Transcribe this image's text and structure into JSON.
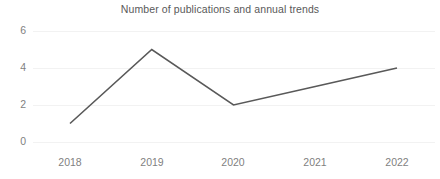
{
  "chart_data": {
    "type": "line",
    "title": "Number of publications and annual trends",
    "xlabel": "",
    "ylabel": "",
    "categories": [
      "2018",
      "2019",
      "2020",
      "2021",
      "2022"
    ],
    "x": [
      2018,
      2019,
      2020,
      2021,
      2022
    ],
    "values": [
      1,
      5,
      2,
      3,
      4
    ],
    "series": [
      {
        "name": "Number of publications",
        "values": [
          1,
          5,
          2,
          3,
          4
        ]
      }
    ],
    "ylim": [
      0,
      6
    ],
    "xlim": [
      2018,
      2022
    ],
    "y_ticks": [
      0,
      2,
      4,
      6
    ],
    "y_tick_labels": [
      "0",
      "2",
      "4",
      "6"
    ],
    "x_tick_labels": [
      "2018",
      "2019",
      "2020",
      "2021",
      "2022"
    ],
    "grid": {
      "horizontal": true,
      "vertical": false
    },
    "legend": {
      "visible": false,
      "position": "none"
    },
    "markers": false,
    "colors": {
      "line": "#595959",
      "gridline": "#f2f2f2",
      "title_text": "#595959",
      "tick_text": "#7f7f7f",
      "background": "#ffffff"
    }
  }
}
